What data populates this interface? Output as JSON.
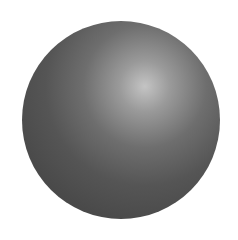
{
  "image": {
    "subject": "shaded-sphere",
    "background_color": "#ffffff",
    "sphere_base_color": "#4a4a4a",
    "highlight_color": "#c4c4c4"
  }
}
